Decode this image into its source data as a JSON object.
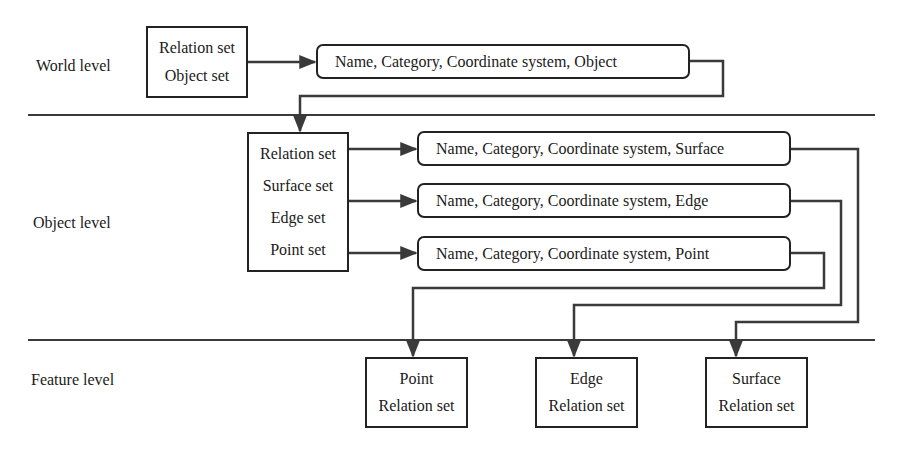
{
  "levels": {
    "world": "World level",
    "object": "Object level",
    "feature": "Feature level"
  },
  "world_box": {
    "items": [
      "Relation set",
      "Object set"
    ]
  },
  "world_attr_box": {
    "label": "Name, Category, Coordinate system, Object"
  },
  "object_box": {
    "items": [
      "Relation set",
      "Surface set",
      "Edge set",
      "Point set"
    ]
  },
  "object_attr_boxes": [
    {
      "label": "Name, Category, Coordinate system, Surface"
    },
    {
      "label": "Name, Category, Coordinate system, Edge"
    },
    {
      "label": "Name, Category, Coordinate system, Point"
    }
  ],
  "feature_boxes": [
    {
      "title": "Point",
      "sub": "Relation set"
    },
    {
      "title": "Edge",
      "sub": "Relation set"
    },
    {
      "title": "Surface",
      "sub": "Relation set"
    }
  ],
  "colors": {
    "line": "#3a3a3a",
    "box_border": "#222222",
    "background": "#ffffff"
  }
}
